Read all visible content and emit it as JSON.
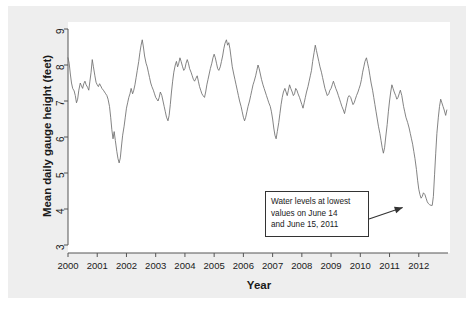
{
  "chart_data": {
    "type": "line",
    "title": "",
    "xlabel": "Year",
    "ylabel": "Mean daily gauge height (feet)",
    "xlim": [
      2000,
      2013
    ],
    "ylim": [
      3,
      9
    ],
    "grid": false,
    "legend": null,
    "series_name": "Mean daily gauge height",
    "line_color": "#6e6e6e",
    "y_ticks": [
      9,
      8,
      7,
      6,
      5,
      4,
      3
    ],
    "x_ticks": [
      2000,
      2001,
      2002,
      2003,
      2004,
      2005,
      2006,
      2007,
      2008,
      2009,
      2010,
      2011,
      2012
    ],
    "annotations": [
      {
        "name": "lowest-values-callout",
        "lines": [
          "Water levels at lowest",
          "values on June 14",
          "and June 15, 2011"
        ],
        "points_to_x": 2011.45,
        "points_to_y": 4.1
      }
    ],
    "x": [
      2000.0,
      2000.04,
      2000.08,
      2000.12,
      2000.16,
      2000.21,
      2000.25,
      2000.29,
      2000.33,
      2000.37,
      2000.42,
      2000.46,
      2000.5,
      2000.54,
      2000.58,
      2000.62,
      2000.67,
      2000.71,
      2000.75,
      2000.79,
      2000.83,
      2000.87,
      2000.92,
      2000.96,
      2001.0,
      2001.04,
      2001.08,
      2001.12,
      2001.16,
      2001.21,
      2001.25,
      2001.29,
      2001.33,
      2001.37,
      2001.42,
      2001.46,
      2001.5,
      2001.54,
      2001.58,
      2001.62,
      2001.67,
      2001.71,
      2001.75,
      2001.79,
      2001.83,
      2001.87,
      2001.92,
      2001.96,
      2002.0,
      2002.04,
      2002.08,
      2002.12,
      2002.16,
      2002.21,
      2002.25,
      2002.29,
      2002.33,
      2002.37,
      2002.42,
      2002.46,
      2002.5,
      2002.54,
      2002.58,
      2002.62,
      2002.67,
      2002.71,
      2002.75,
      2002.79,
      2002.83,
      2002.87,
      2002.92,
      2002.96,
      2003.0,
      2003.04,
      2003.08,
      2003.12,
      2003.16,
      2003.21,
      2003.25,
      2003.29,
      2003.33,
      2003.37,
      2003.42,
      2003.46,
      2003.5,
      2003.54,
      2003.58,
      2003.62,
      2003.67,
      2003.71,
      2003.75,
      2003.79,
      2003.83,
      2003.87,
      2003.92,
      2003.96,
      2004.0,
      2004.04,
      2004.08,
      2004.12,
      2004.16,
      2004.21,
      2004.25,
      2004.29,
      2004.33,
      2004.37,
      2004.42,
      2004.46,
      2004.5,
      2004.54,
      2004.58,
      2004.62,
      2004.67,
      2004.71,
      2004.75,
      2004.79,
      2004.83,
      2004.87,
      2004.92,
      2004.96,
      2005.0,
      2005.04,
      2005.08,
      2005.12,
      2005.16,
      2005.21,
      2005.25,
      2005.29,
      2005.33,
      2005.37,
      2005.42,
      2005.46,
      2005.5,
      2005.54,
      2005.58,
      2005.62,
      2005.67,
      2005.71,
      2005.75,
      2005.79,
      2005.83,
      2005.87,
      2005.92,
      2005.96,
      2006.0,
      2006.04,
      2006.08,
      2006.12,
      2006.16,
      2006.21,
      2006.25,
      2006.29,
      2006.33,
      2006.37,
      2006.42,
      2006.46,
      2006.5,
      2006.54,
      2006.58,
      2006.62,
      2006.67,
      2006.71,
      2006.75,
      2006.79,
      2006.83,
      2006.87,
      2006.92,
      2006.96,
      2007.0,
      2007.04,
      2007.08,
      2007.12,
      2007.16,
      2007.21,
      2007.25,
      2007.29,
      2007.33,
      2007.37,
      2007.42,
      2007.46,
      2007.5,
      2007.54,
      2007.58,
      2007.62,
      2007.67,
      2007.71,
      2007.75,
      2007.79,
      2007.83,
      2007.87,
      2007.92,
      2007.96,
      2008.0,
      2008.04,
      2008.08,
      2008.12,
      2008.16,
      2008.21,
      2008.25,
      2008.29,
      2008.33,
      2008.37,
      2008.42,
      2008.46,
      2008.5,
      2008.54,
      2008.58,
      2008.62,
      2008.67,
      2008.71,
      2008.75,
      2008.79,
      2008.83,
      2008.87,
      2008.92,
      2008.96,
      2009.0,
      2009.04,
      2009.08,
      2009.12,
      2009.16,
      2009.21,
      2009.25,
      2009.29,
      2009.33,
      2009.37,
      2009.42,
      2009.46,
      2009.5,
      2009.54,
      2009.58,
      2009.62,
      2009.67,
      2009.71,
      2009.75,
      2009.79,
      2009.83,
      2009.87,
      2009.92,
      2009.96,
      2010.0,
      2010.04,
      2010.08,
      2010.12,
      2010.16,
      2010.21,
      2010.25,
      2010.29,
      2010.33,
      2010.37,
      2010.42,
      2010.46,
      2010.5,
      2010.54,
      2010.58,
      2010.62,
      2010.67,
      2010.71,
      2010.75,
      2010.79,
      2010.83,
      2010.87,
      2010.92,
      2010.96,
      2011.0,
      2011.04,
      2011.08,
      2011.12,
      2011.16,
      2011.21,
      2011.25,
      2011.29,
      2011.33,
      2011.37,
      2011.42,
      2011.45,
      2011.48,
      2011.52,
      2011.56,
      2011.62,
      2011.67,
      2011.71,
      2011.75,
      2011.79,
      2011.83,
      2011.87,
      2011.92,
      2011.96,
      2012.0,
      2012.04,
      2012.08,
      2012.12,
      2012.16,
      2012.21,
      2012.25,
      2012.29,
      2012.33,
      2012.37,
      2012.42,
      2012.46,
      2012.5,
      2012.54,
      2012.58,
      2012.62,
      2012.67,
      2012.71,
      2012.75,
      2012.79,
      2012.83,
      2012.87,
      2012.92,
      2012.96
    ],
    "y": [
      8.2,
      8.05,
      7.75,
      7.5,
      7.35,
      7.28,
      7.15,
      6.95,
      7.05,
      7.3,
      7.5,
      7.42,
      7.35,
      7.48,
      7.55,
      7.45,
      7.38,
      7.3,
      7.55,
      7.8,
      8.15,
      7.95,
      7.7,
      7.52,
      7.45,
      7.4,
      7.48,
      7.42,
      7.35,
      7.3,
      7.25,
      7.2,
      7.15,
      7.05,
      6.85,
      6.55,
      6.2,
      5.95,
      6.15,
      5.9,
      5.6,
      5.4,
      5.28,
      5.42,
      5.75,
      6.05,
      6.3,
      6.55,
      6.8,
      6.95,
      7.1,
      7.2,
      7.35,
      7.2,
      7.3,
      7.45,
      7.65,
      7.85,
      8.1,
      8.35,
      8.55,
      8.7,
      8.5,
      8.25,
      8.05,
      7.95,
      7.8,
      7.65,
      7.5,
      7.4,
      7.3,
      7.2,
      7.1,
      7.05,
      7.0,
      7.1,
      7.25,
      7.15,
      7.0,
      6.85,
      6.7,
      6.55,
      6.45,
      6.6,
      6.9,
      7.25,
      7.55,
      7.8,
      8.0,
      8.1,
      7.95,
      8.05,
      8.2,
      8.1,
      7.95,
      7.85,
      7.9,
      8.05,
      8.15,
      8.05,
      7.9,
      7.8,
      7.7,
      7.6,
      7.55,
      7.62,
      7.7,
      7.55,
      7.4,
      7.3,
      7.2,
      7.15,
      7.1,
      7.25,
      7.45,
      7.6,
      7.75,
      7.9,
      8.05,
      8.2,
      8.3,
      8.2,
      8.05,
      7.9,
      7.85,
      7.95,
      8.1,
      8.25,
      8.45,
      8.6,
      8.7,
      8.55,
      8.62,
      8.45,
      8.2,
      7.95,
      7.75,
      7.6,
      7.45,
      7.3,
      7.15,
      7.0,
      6.85,
      6.7,
      6.55,
      6.45,
      6.55,
      6.7,
      6.85,
      7.0,
      7.15,
      7.3,
      7.45,
      7.55,
      7.7,
      7.85,
      8.0,
      7.9,
      7.75,
      7.6,
      7.45,
      7.35,
      7.25,
      7.15,
      7.05,
      6.95,
      6.85,
      6.7,
      6.5,
      6.25,
      6.05,
      5.95,
      6.15,
      6.4,
      6.65,
      6.9,
      7.1,
      7.25,
      7.35,
      7.25,
      7.15,
      7.3,
      7.45,
      7.35,
      7.25,
      7.15,
      7.2,
      7.35,
      7.3,
      7.2,
      7.1,
      7.0,
      6.9,
      6.8,
      6.95,
      7.1,
      7.25,
      7.4,
      7.55,
      7.7,
      7.85,
      8.1,
      8.35,
      8.55,
      8.4,
      8.25,
      8.1,
      7.95,
      7.8,
      7.65,
      7.5,
      7.35,
      7.25,
      7.15,
      7.2,
      7.3,
      7.35,
      7.45,
      7.55,
      7.45,
      7.35,
      7.25,
      7.15,
      7.05,
      6.95,
      6.85,
      6.75,
      6.65,
      6.8,
      6.95,
      7.1,
      7.15,
      7.1,
      7.0,
      6.9,
      6.95,
      7.05,
      7.15,
      7.25,
      7.35,
      7.45,
      7.6,
      7.8,
      7.95,
      8.1,
      8.2,
      8.05,
      7.9,
      7.7,
      7.5,
      7.3,
      7.1,
      6.9,
      6.7,
      6.5,
      6.3,
      6.1,
      5.9,
      5.7,
      5.55,
      5.7,
      6.0,
      6.35,
      6.7,
      7.0,
      7.25,
      7.45,
      7.35,
      7.25,
      7.15,
      7.05,
      7.1,
      7.2,
      7.3,
      7.15,
      7.0,
      6.85,
      6.7,
      6.55,
      6.4,
      6.25,
      6.1,
      5.95,
      5.8,
      5.6,
      5.4,
      5.1,
      4.8,
      4.55,
      4.4,
      4.3,
      4.35,
      4.45,
      4.4,
      4.3,
      4.2,
      4.15,
      4.12,
      4.1,
      4.1,
      4.35,
      4.95,
      5.55,
      6.1,
      6.55,
      6.85,
      7.05,
      6.95,
      6.85,
      6.75,
      6.6,
      6.75,
      7.05,
      7.3,
      7.55,
      7.75,
      7.95,
      8.15,
      8.35,
      8.5,
      8.6,
      8.45,
      8.3,
      8.2,
      8.35,
      8.2,
      8.05,
      7.95,
      7.85,
      7.9,
      8.05,
      8.2,
      8.1,
      7.95,
      7.85,
      7.9
    ]
  }
}
